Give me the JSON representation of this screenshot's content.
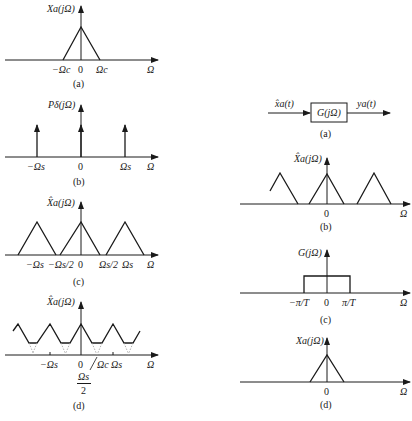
{
  "left": {
    "a": {
      "ylabel": "Xa(jΩ)",
      "ticks": [
        "−Ωc",
        "0",
        "Ωc"
      ],
      "xlabel": "Ω",
      "caption": "(a)"
    },
    "b": {
      "ylabel": "Pδ(jΩ)",
      "ticks": [
        "−Ωs",
        "0",
        "Ωs"
      ],
      "xlabel": "Ω",
      "caption": "(b)"
    },
    "c": {
      "ylabel": "X̂a(jΩ)",
      "ticks": [
        "−Ωs",
        "−Ωs/2",
        "0",
        "Ωs/2",
        "Ωs"
      ],
      "xlabel": "Ω",
      "caption": "(c)"
    },
    "d": {
      "ylabel": "X̂a(jΩ)",
      "ticks": [
        "−Ωs",
        "0",
        "Ωc",
        "Ωs"
      ],
      "frac_num": "Ωs",
      "frac_den": "2",
      "xlabel": "Ω",
      "caption": "(d)"
    }
  },
  "right": {
    "a": {
      "input": "x̂a(t)",
      "block": "G(jΩ)",
      "output": "ya(t)",
      "caption": "(a)"
    },
    "b": {
      "ylabel": "X̂a(jΩ)",
      "ticks": [
        "0"
      ],
      "xlabel": "Ω",
      "caption": "(b)"
    },
    "c": {
      "ylabel": "G(jΩ)",
      "ticks": [
        "−π/T",
        "0",
        "π/T"
      ],
      "xlabel": "Ω",
      "caption": "(c)"
    },
    "d": {
      "ylabel": "Xa(jΩ)",
      "ticks": [
        "0"
      ],
      "xlabel": "Ω",
      "caption": "(d)"
    }
  }
}
